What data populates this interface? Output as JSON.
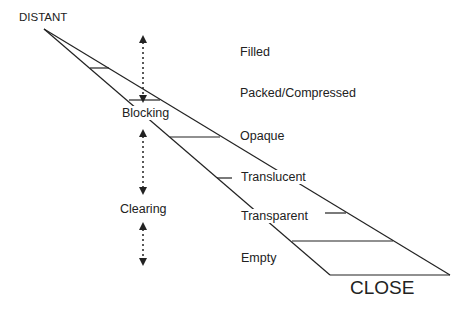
{
  "diagram": {
    "ends": {
      "distant": "DISTANT",
      "close": "CLOSE"
    },
    "processes": [
      "Blocking",
      "Clearing"
    ],
    "states": [
      "Filled",
      "Packed/Compressed",
      "Opaque",
      "Translucent",
      "Transparent",
      "Empty"
    ],
    "colors": {
      "line": "#222222",
      "background": "#ffffff"
    }
  }
}
